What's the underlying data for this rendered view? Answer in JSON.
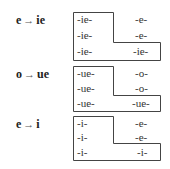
{
  "groups": [
    {
      "rule": {
        "from": "e",
        "arrow": "→",
        "to": "ie"
      },
      "left": [
        "-ie-",
        "-ie-",
        "-ie-"
      ],
      "right": [
        "-e-",
        "-e-",
        "-ie-"
      ]
    },
    {
      "rule": {
        "from": "o",
        "arrow": "→",
        "to": "ue"
      },
      "left": [
        "-ue-",
        "-ue-",
        "-ue-"
      ],
      "right": [
        "-o-",
        "-o-",
        "-ue-"
      ]
    },
    {
      "rule": {
        "from": "e",
        "arrow": "→",
        "to": "i"
      },
      "left": [
        "-i-",
        "-i-",
        "-i-"
      ],
      "right": [
        "-e-",
        "-e-",
        "-i-"
      ]
    }
  ]
}
